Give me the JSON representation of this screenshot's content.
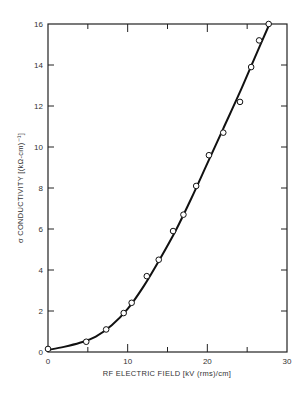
{
  "chart_data": {
    "type": "scatter",
    "title": "",
    "xlabel": "RF ELECTRIC FIELD [kV (rms)/cm]",
    "ylabel": "σ CONDUCTIVITY [(kΩ-cm)⁻¹]",
    "xlim": [
      0,
      30
    ],
    "ylim": [
      0,
      16
    ],
    "x_ticks": [
      0,
      10,
      20,
      30
    ],
    "x_minor_ticks": [
      5,
      15,
      25
    ],
    "y_ticks": [
      0,
      2,
      4,
      6,
      8,
      10,
      12,
      14,
      16
    ],
    "grid": false,
    "legend": null,
    "series": [
      {
        "name": "measured",
        "style": "open-circle markers",
        "x": [
          0,
          4.8,
          7.3,
          9.5,
          10.5,
          12.4,
          13.9,
          15.7,
          17.0,
          18.6,
          20.2,
          22.0,
          24.1,
          25.5,
          26.5,
          27.7
        ],
        "y": [
          0.15,
          0.5,
          1.1,
          1.9,
          2.4,
          3.7,
          4.5,
          5.9,
          6.7,
          8.1,
          9.6,
          10.7,
          12.2,
          13.9,
          15.2,
          16.0
        ]
      },
      {
        "name": "fit",
        "style": "solid line",
        "x": [
          0,
          2,
          4,
          6,
          8,
          10,
          12,
          14,
          16,
          18,
          20,
          22,
          24,
          26,
          27.8
        ],
        "y": [
          0.1,
          0.25,
          0.45,
          0.75,
          1.3,
          2.1,
          3.2,
          4.5,
          5.9,
          7.5,
          9.2,
          10.9,
          12.6,
          14.4,
          16.0
        ]
      }
    ]
  }
}
